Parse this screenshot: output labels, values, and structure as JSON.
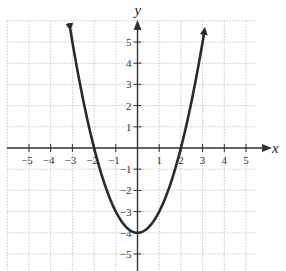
{
  "chart_data": {
    "type": "line",
    "title": "",
    "function": "y = x^2 - 4",
    "xlabel": "x",
    "ylabel": "y",
    "xlim": [
      -6,
      5.5
    ],
    "ylim": [
      -5.8,
      6
    ],
    "grid": true,
    "x_ticks": [
      -5,
      -4,
      -3,
      -2,
      -1,
      1,
      2,
      3,
      4,
      5
    ],
    "x_tick_labels": [
      "−5",
      "−4",
      "−3",
      "−2",
      "−1",
      "1",
      "2",
      "3",
      "4",
      "5"
    ],
    "y_ticks": [
      5,
      4,
      3,
      2,
      1,
      -1,
      -2,
      -3,
      -4,
      -5
    ],
    "y_tick_labels": [
      "5",
      "4",
      "3",
      "2",
      "1",
      "−1",
      "−2",
      "−3",
      "−4",
      "−5"
    ],
    "series": [
      {
        "name": "parabola",
        "x": [
          -3.1,
          -3,
          -2.5,
          -2,
          -1.5,
          -1,
          -0.5,
          0,
          0.5,
          1,
          1.5,
          2,
          2.5,
          3,
          3.1
        ],
        "y": [
          5.61,
          5,
          2.25,
          0,
          -1.75,
          -3,
          -3.75,
          -4,
          -3.75,
          -3,
          -1.75,
          0,
          2.25,
          5,
          5.61
        ],
        "arrows_at_ends": true,
        "color": "#2a2a2a"
      }
    ],
    "key_points": {
      "vertex": [
        0,
        -4
      ],
      "x_intercepts": [
        [
          -2,
          0
        ],
        [
          2,
          0
        ]
      ],
      "y_intercept": [
        0,
        -4
      ]
    }
  },
  "axes": {
    "x_label": "x",
    "y_label": "y"
  },
  "colors": {
    "grid": "#b9b9b9",
    "axis": "#333333",
    "curve": "#2a2a2a"
  }
}
